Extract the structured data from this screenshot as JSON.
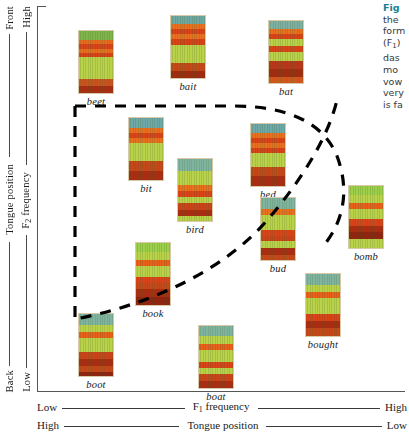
{
  "figure": {
    "kind": "vowel-formant-scatter",
    "left_axis_outer": {
      "top": "Front",
      "label": "Tongue position",
      "bottom": "Back"
    },
    "left_axis_inner": {
      "top": "High",
      "label": "F",
      "label_sub": "2",
      "label_rest": " frequency",
      "bottom": "Low"
    },
    "bottom_axis_upper": {
      "left": "Low",
      "label": "F",
      "label_sub": "1",
      "label_rest": " frequency",
      "right": "High"
    },
    "bottom_axis_lower": {
      "left": "High",
      "label": "Tongue position",
      "right": "Low"
    },
    "boundary": {
      "style": "dashed",
      "color": "#000000",
      "note": "dashed outline enclosing central/lax vowels"
    }
  },
  "caption": {
    "lines": [
      "Fig",
      "the",
      "form",
      "(F",
      "das",
      "mo",
      "vow",
      "very",
      "is fa"
    ],
    "sub_index": "1",
    "accent_color": "#1a7f92",
    "truncated": true
  },
  "chart_data": {
    "type": "scatter",
    "title": "",
    "xlabel": "F1 frequency",
    "ylabel": "F2 frequency",
    "xlim": [
      0,
      100
    ],
    "ylim": [
      0,
      100
    ],
    "grid": false,
    "legend": "none",
    "annotations": [
      "dashed boundary encloses the lax / central vowels"
    ],
    "points": [
      {
        "label": "beet",
        "x": 12,
        "y": 92,
        "inside_boundary": false,
        "px": 78,
        "py": 30,
        "bands": [
          {
            "t": 0,
            "h": 9,
            "c": "#7fb54a"
          },
          {
            "t": 9,
            "h": 4,
            "c": "#e86a1e"
          },
          {
            "t": 13,
            "h": 5,
            "c": "#d9431a"
          },
          {
            "t": 18,
            "h": 4,
            "c": "#e8701f"
          },
          {
            "t": 22,
            "h": 4,
            "c": "#d8421a"
          },
          {
            "t": 26,
            "h": 22,
            "c": "#b9d24a"
          },
          {
            "t": 48,
            "h": 7,
            "c": "#c9541f"
          },
          {
            "t": 55,
            "h": 7,
            "c": "#a82d12"
          }
        ]
      },
      {
        "label": "bait",
        "x": 28,
        "y": 84,
        "inside_boundary": false,
        "px": 170,
        "py": 15,
        "bands": [
          {
            "t": 0,
            "h": 8,
            "c": "#6fa8a0"
          },
          {
            "t": 8,
            "h": 5,
            "c": "#e8701f"
          },
          {
            "t": 13,
            "h": 5,
            "c": "#d8431a"
          },
          {
            "t": 18,
            "h": 5,
            "c": "#e8701f"
          },
          {
            "t": 23,
            "h": 6,
            "c": "#d8421a"
          },
          {
            "t": 29,
            "h": 18,
            "c": "#b9d24a"
          },
          {
            "t": 47,
            "h": 8,
            "c": "#c4481a"
          },
          {
            "t": 55,
            "h": 7,
            "c": "#9e2a10"
          }
        ]
      },
      {
        "label": "bat",
        "x": 47,
        "y": 78,
        "inside_boundary": false,
        "px": 268,
        "py": 20,
        "bands": [
          {
            "t": 0,
            "h": 8,
            "c": "#7fb0a4"
          },
          {
            "t": 8,
            "h": 5,
            "c": "#e8701f"
          },
          {
            "t": 13,
            "h": 5,
            "c": "#d8431a"
          },
          {
            "t": 18,
            "h": 7,
            "c": "#b9d24a"
          },
          {
            "t": 25,
            "h": 6,
            "c": "#d8451a"
          },
          {
            "t": 31,
            "h": 9,
            "c": "#b9d24a"
          },
          {
            "t": 40,
            "h": 8,
            "c": "#b8371a"
          },
          {
            "t": 48,
            "h": 8,
            "c": "#a02c11"
          },
          {
            "t": 56,
            "h": 6,
            "c": "#d4581e"
          }
        ]
      },
      {
        "label": "bit",
        "x": 23,
        "y": 70,
        "inside_boundary": true,
        "px": 128,
        "py": 117,
        "bands": [
          {
            "t": 0,
            "h": 10,
            "c": "#6fa8a8"
          },
          {
            "t": 10,
            "h": 5,
            "c": "#e8701f"
          },
          {
            "t": 15,
            "h": 5,
            "c": "#d8431a"
          },
          {
            "t": 20,
            "h": 5,
            "c": "#e8701f"
          },
          {
            "t": 25,
            "h": 18,
            "c": "#b9d24a"
          },
          {
            "t": 43,
            "h": 10,
            "c": "#c4481a"
          },
          {
            "t": 53,
            "h": 9,
            "c": "#a82d12"
          }
        ]
      },
      {
        "label": "bird",
        "x": 36,
        "y": 59,
        "inside_boundary": true,
        "px": 177,
        "py": 158,
        "bands": [
          {
            "t": 0,
            "h": 12,
            "c": "#7fb5a0"
          },
          {
            "t": 12,
            "h": 14,
            "c": "#b9d24a"
          },
          {
            "t": 26,
            "h": 6,
            "c": "#e8701f"
          },
          {
            "t": 32,
            "h": 6,
            "c": "#d8431a"
          },
          {
            "t": 38,
            "h": 6,
            "c": "#b9d24a"
          },
          {
            "t": 44,
            "h": 7,
            "c": "#c9441a"
          },
          {
            "t": 51,
            "h": 6,
            "c": "#a82d12"
          },
          {
            "t": 57,
            "h": 5,
            "c": "#b9d24a"
          }
        ]
      },
      {
        "label": "bed",
        "x": 57,
        "y": 69,
        "inside_boundary": true,
        "px": 250,
        "py": 123,
        "bands": [
          {
            "t": 0,
            "h": 9,
            "c": "#6fa8a8"
          },
          {
            "t": 9,
            "h": 5,
            "c": "#e8701f"
          },
          {
            "t": 14,
            "h": 5,
            "c": "#d8431a"
          },
          {
            "t": 19,
            "h": 5,
            "c": "#e8701f"
          },
          {
            "t": 24,
            "h": 5,
            "c": "#d8421a"
          },
          {
            "t": 29,
            "h": 14,
            "c": "#b9d24a"
          },
          {
            "t": 43,
            "h": 9,
            "c": "#c4481a"
          },
          {
            "t": 52,
            "h": 10,
            "c": "#a82d12"
          }
        ]
      },
      {
        "label": "bud",
        "x": 62,
        "y": 46,
        "inside_boundary": true,
        "px": 260,
        "py": 197,
        "bands": [
          {
            "t": 0,
            "h": 11,
            "c": "#7fb5a0"
          },
          {
            "t": 11,
            "h": 6,
            "c": "#e8701f"
          },
          {
            "t": 17,
            "h": 15,
            "c": "#b9d24a"
          },
          {
            "t": 32,
            "h": 6,
            "c": "#d8431a"
          },
          {
            "t": 38,
            "h": 5,
            "c": "#c9441a"
          },
          {
            "t": 43,
            "h": 7,
            "c": "#b9d24a"
          },
          {
            "t": 50,
            "h": 7,
            "c": "#a82d12"
          },
          {
            "t": 57,
            "h": 5,
            "c": "#c4481a"
          }
        ]
      },
      {
        "label": "bomb",
        "x": 86,
        "y": 40,
        "inside_boundary": false,
        "px": 348,
        "py": 185,
        "bands": [
          {
            "t": 0,
            "h": 9,
            "c": "#9ccf4a"
          },
          {
            "t": 9,
            "h": 8,
            "c": "#b9d24a"
          },
          {
            "t": 17,
            "h": 6,
            "c": "#e8601c"
          },
          {
            "t": 23,
            "h": 10,
            "c": "#b9d24a"
          },
          {
            "t": 33,
            "h": 7,
            "c": "#d8431a"
          },
          {
            "t": 40,
            "h": 6,
            "c": "#a82d12"
          },
          {
            "t": 46,
            "h": 7,
            "c": "#8f2410"
          },
          {
            "t": 53,
            "h": 9,
            "c": "#b9d24a"
          }
        ]
      },
      {
        "label": "book",
        "x": 31,
        "y": 32,
        "inside_boundary": true,
        "px": 135,
        "py": 242,
        "bands": [
          {
            "t": 0,
            "h": 9,
            "c": "#9ccf4a"
          },
          {
            "t": 9,
            "h": 8,
            "c": "#b9d24a"
          },
          {
            "t": 17,
            "h": 6,
            "c": "#e8601c"
          },
          {
            "t": 23,
            "h": 11,
            "c": "#b9d24a"
          },
          {
            "t": 34,
            "h": 6,
            "c": "#d8431a"
          },
          {
            "t": 40,
            "h": 6,
            "c": "#c4481a"
          },
          {
            "t": 46,
            "h": 8,
            "c": "#a82d12"
          },
          {
            "t": 54,
            "h": 8,
            "c": "#8f2410"
          }
        ]
      },
      {
        "label": "bought",
        "x": 72,
        "y": 20,
        "inside_boundary": true,
        "px": 305,
        "py": 273,
        "bands": [
          {
            "t": 0,
            "h": 11,
            "c": "#7fb5a0"
          },
          {
            "t": 11,
            "h": 7,
            "c": "#b9d24a"
          },
          {
            "t": 18,
            "h": 6,
            "c": "#e8601c"
          },
          {
            "t": 24,
            "h": 16,
            "c": "#b9d24a"
          },
          {
            "t": 40,
            "h": 7,
            "c": "#d8431a"
          },
          {
            "t": 47,
            "h": 7,
            "c": "#a82d12"
          },
          {
            "t": 54,
            "h": 8,
            "c": "#c4481a"
          }
        ]
      },
      {
        "label": "boot",
        "x": 10,
        "y": 10,
        "inside_boundary": false,
        "px": 78,
        "py": 313,
        "bands": [
          {
            "t": 0,
            "h": 11,
            "c": "#7fb5a0"
          },
          {
            "t": 11,
            "h": 7,
            "c": "#b9d24a"
          },
          {
            "t": 18,
            "h": 6,
            "c": "#e8601c"
          },
          {
            "t": 24,
            "h": 14,
            "c": "#b9d24a"
          },
          {
            "t": 38,
            "h": 7,
            "c": "#c9441a"
          },
          {
            "t": 45,
            "h": 7,
            "c": "#a82d12"
          },
          {
            "t": 52,
            "h": 6,
            "c": "#c4481a"
          },
          {
            "t": 58,
            "h": 4,
            "c": "#8f2410"
          }
        ]
      },
      {
        "label": "boat",
        "x": 43,
        "y": 8,
        "inside_boundary": false,
        "px": 198,
        "py": 325,
        "bands": [
          {
            "t": 0,
            "h": 10,
            "c": "#7fb5a0"
          },
          {
            "t": 10,
            "h": 8,
            "c": "#b9d24a"
          },
          {
            "t": 18,
            "h": 6,
            "c": "#e8601c"
          },
          {
            "t": 24,
            "h": 12,
            "c": "#b9d24a"
          },
          {
            "t": 36,
            "h": 6,
            "c": "#d8431a"
          },
          {
            "t": 42,
            "h": 6,
            "c": "#b9d24a"
          },
          {
            "t": 48,
            "h": 7,
            "c": "#c9441a"
          },
          {
            "t": 55,
            "h": 7,
            "c": "#a82d12"
          }
        ]
      }
    ]
  }
}
